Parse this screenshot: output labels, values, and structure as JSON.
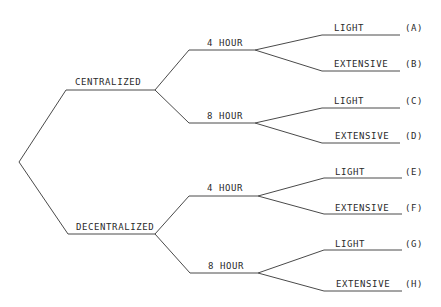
{
  "diagram": {
    "type": "decision-tree",
    "root": "root",
    "level1": [
      {
        "id": "centralized",
        "label": "CENTRALIZED"
      },
      {
        "id": "decentralized",
        "label": "DECENTRALIZED"
      }
    ],
    "level2": [
      {
        "parent": "centralized",
        "label": "4 HOUR"
      },
      {
        "parent": "centralized",
        "label": "8 HOUR"
      },
      {
        "parent": "decentralized",
        "label": "4 HOUR"
      },
      {
        "parent": "decentralized",
        "label": "8 HOUR"
      }
    ],
    "leaves": [
      {
        "label": "LIGHT",
        "tag": "(A)"
      },
      {
        "label": "EXTENSIVE",
        "tag": "(B)"
      },
      {
        "label": "LIGHT",
        "tag": "(C)"
      },
      {
        "label": "EXTENSIVE",
        "tag": "(D)"
      },
      {
        "label": "LIGHT",
        "tag": "(E)"
      },
      {
        "label": "EXTENSIVE",
        "tag": "(F)"
      },
      {
        "label": "LIGHT",
        "tag": "(G)"
      },
      {
        "label": "EXTENSIVE",
        "tag": "(H)"
      }
    ],
    "colors": {
      "line": "#4a4a4a",
      "text": "#2a2a2a",
      "background": "#ffffff"
    }
  }
}
